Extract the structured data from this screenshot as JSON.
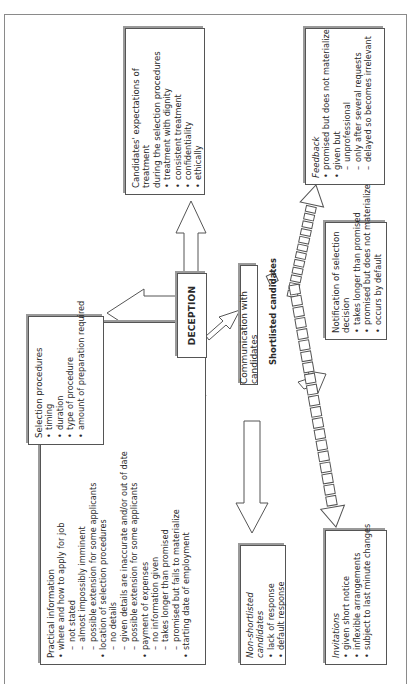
{
  "diagram": {
    "center": {
      "label": "DECEPTION"
    },
    "communication": {
      "label": "Communication with candidates"
    },
    "shortlisted_label": "Shortlisted candidates",
    "selection_procedures": {
      "title": "Selection procedures",
      "items": [
        "timing",
        "duration",
        "type of procedure",
        "amount of preparation required"
      ]
    },
    "expectations": {
      "title_line1": "Candidates' expectations of treatment",
      "title_line2": "during the selection procedures",
      "items": [
        "treatment with dignity",
        "consistent treatment",
        "confidentiality",
        "ethically"
      ]
    },
    "practical_information": {
      "title": "Practical information",
      "items": [
        {
          "text": "where and how to apply for job",
          "level": 1
        },
        {
          "text": "not stated",
          "level": 2
        },
        {
          "text": "almost impossibly imminent",
          "level": 2
        },
        {
          "text": "possible extension for some applicants",
          "level": 2
        },
        {
          "text": "location of selection procedures",
          "level": 1
        },
        {
          "text": "no details",
          "level": 2
        },
        {
          "text": "given details are inaccurate and/or out of date",
          "level": 2
        },
        {
          "text": "possible extension for some applicants",
          "level": 2
        },
        {
          "text": "payment of expenses",
          "level": 1
        },
        {
          "text": "no information given",
          "level": 2
        },
        {
          "text": "takes longer than promised",
          "level": 2
        },
        {
          "text": "promised but fails to materialize",
          "level": 2
        },
        {
          "text": "starting date of employment",
          "level": 1
        }
      ]
    },
    "non_shortlisted": {
      "title": "Non-shortlisted candidates",
      "items": [
        "lack of response",
        "default response"
      ]
    },
    "feedback": {
      "title": "Feedback",
      "items": [
        {
          "text": "promised but does not materialize",
          "level": 1
        },
        {
          "text": "given but",
          "level": 1
        },
        {
          "text": "unprofessional",
          "level": 2
        },
        {
          "text": "only after several requests",
          "level": 2
        },
        {
          "text": "delayed so becomes irrelevant",
          "level": 2
        }
      ]
    },
    "notification": {
      "title": "Notification of selection decision",
      "items": [
        "takes longer than promised",
        "promised but does not materialize",
        "occurs by default"
      ]
    },
    "invitations": {
      "title": "Invitations",
      "items": [
        "given short notice",
        "inflexible arrangements",
        "subject to last minute changes"
      ]
    }
  }
}
